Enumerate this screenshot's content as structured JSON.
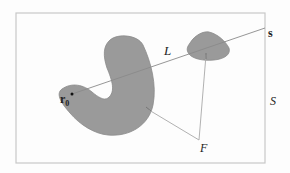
{
  "diagram": {
    "labels": {
      "line": "L",
      "source": "s",
      "origin": "r",
      "origin_sub": "0",
      "region": "S",
      "field_point": "F"
    },
    "colors": {
      "background": "#fdfdfd",
      "frame": "#c8c8c8",
      "shape_fill": "#9a9a9a",
      "shape_stroke": "#8a8a8a",
      "line": "#9a9a9a",
      "text": "#222222"
    }
  }
}
